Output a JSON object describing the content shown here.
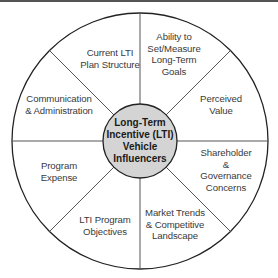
{
  "diagram": {
    "type": "radial-wheel",
    "center": {
      "label": "Long-Term\nIncentive (LTI)\nVehicle\nInfluencers"
    },
    "segments": [
      {
        "label": "Current LTI\nPlan Structure"
      },
      {
        "label": "Ability to\nSet/Measure\nLong-Term\nGoals"
      },
      {
        "label": "Perceived\nValue"
      },
      {
        "label": "Shareholder\n& Governance\nConcerns"
      },
      {
        "label": "Market Trends\n& Competitive\nLandscape"
      },
      {
        "label": "LTI Program\nObjectives"
      },
      {
        "label": "Program\nExpense"
      },
      {
        "label": "Communication\n& Administration"
      }
    ],
    "colors": {
      "outline": "#222222",
      "spokes": "#555555",
      "center_fill": "#d4d4d4",
      "background": "#ffffff",
      "top_bar": "#555555"
    }
  }
}
